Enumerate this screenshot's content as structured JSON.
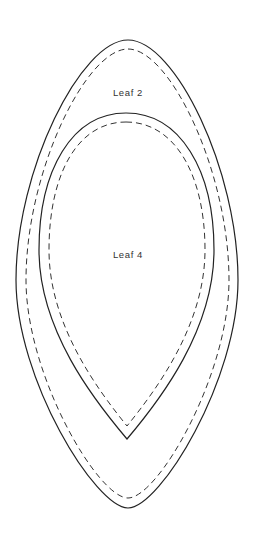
{
  "diagram": {
    "type": "nested leaf pattern pieces",
    "shapes": [
      {
        "id": "leaf-2",
        "label": "Leaf 2",
        "outline": "solid",
        "seam_allowance": "dashed"
      },
      {
        "id": "leaf-4",
        "label": "Leaf 4",
        "outline": "solid",
        "seam_allowance": "dashed"
      }
    ],
    "colors": {
      "stroke": "#222222",
      "background": "#ffffff",
      "text": "#333333"
    }
  }
}
